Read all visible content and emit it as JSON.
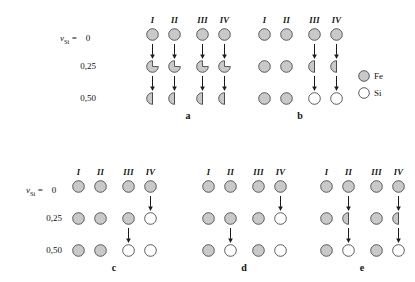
{
  "figure": {
    "decimal_separator": ",",
    "colors": {
      "fe_fill": "#c9c9c9",
      "si_fill": "#ffffff",
      "outline": "#4a4a4a",
      "arrow": "#1a1a1a",
      "background": "#ffffff",
      "text": "#111111"
    },
    "axis_label": {
      "symbol": "ν",
      "subscript": "Si",
      "equals": "="
    },
    "row_labels": [
      "0",
      "0,25",
      "0,50"
    ],
    "column_headers": [
      "I",
      "II",
      "III",
      "IV"
    ],
    "legend": {
      "items": [
        {
          "label": "Fe",
          "kind": "full-gray"
        },
        {
          "label": "Si",
          "kind": "full-white"
        }
      ]
    },
    "panels": [
      {
        "id": "a",
        "label": "a",
        "columns": [
          "I",
          "II",
          "III",
          "IV"
        ],
        "rows": [
          {
            "value": "0",
            "atoms": [
              "full-gray",
              "full-gray",
              "full-gray",
              "full-gray"
            ]
          },
          {
            "value": "0,25",
            "atoms": [
              "pac-gray",
              "pac-gray",
              "pac-gray",
              "pac-gray"
            ]
          },
          {
            "value": "0,50",
            "atoms": [
              "half-gray",
              "half-gray",
              "half-gray",
              "half-gray"
            ]
          }
        ],
        "arrows": [
          {
            "from_row": 0,
            "to_row": 1,
            "column": 0
          },
          {
            "from_row": 0,
            "to_row": 1,
            "column": 1
          },
          {
            "from_row": 0,
            "to_row": 1,
            "column": 2
          },
          {
            "from_row": 0,
            "to_row": 1,
            "column": 3
          },
          {
            "from_row": 1,
            "to_row": 2,
            "column": 0
          },
          {
            "from_row": 1,
            "to_row": 2,
            "column": 1
          },
          {
            "from_row": 1,
            "to_row": 2,
            "column": 2
          },
          {
            "from_row": 1,
            "to_row": 2,
            "column": 3
          }
        ]
      },
      {
        "id": "b",
        "label": "b",
        "columns": [
          "I",
          "II",
          "III",
          "IV"
        ],
        "rows": [
          {
            "value": "0",
            "atoms": [
              "full-gray",
              "full-gray",
              "full-gray",
              "full-gray"
            ]
          },
          {
            "value": "0,25",
            "atoms": [
              "full-gray",
              "full-gray",
              "half-gray",
              "half-gray"
            ]
          },
          {
            "value": "0,50",
            "atoms": [
              "full-gray",
              "full-gray",
              "full-white",
              "full-white"
            ]
          }
        ],
        "arrows": [
          {
            "from_row": 0,
            "to_row": 1,
            "column": 2
          },
          {
            "from_row": 0,
            "to_row": 1,
            "column": 3
          },
          {
            "from_row": 1,
            "to_row": 2,
            "column": 2
          },
          {
            "from_row": 1,
            "to_row": 2,
            "column": 3
          }
        ]
      },
      {
        "id": "c",
        "label": "c",
        "columns": [
          "I",
          "II",
          "III",
          "IV"
        ],
        "rows": [
          {
            "value": "0",
            "atoms": [
              "full-gray",
              "full-gray",
              "full-gray",
              "full-gray"
            ]
          },
          {
            "value": "0,25",
            "atoms": [
              "full-gray",
              "full-gray",
              "full-gray",
              "full-white"
            ]
          },
          {
            "value": "0,50",
            "atoms": [
              "full-gray",
              "full-gray",
              "full-white",
              "full-white"
            ]
          }
        ],
        "arrows": [
          {
            "from_row": 0,
            "to_row": 1,
            "column": 3
          },
          {
            "from_row": 1,
            "to_row": 2,
            "column": 2
          }
        ]
      },
      {
        "id": "d",
        "label": "d",
        "columns": [
          "I",
          "II",
          "III",
          "IV"
        ],
        "rows": [
          {
            "value": "0",
            "atoms": [
              "full-gray",
              "full-gray",
              "full-gray",
              "full-gray"
            ]
          },
          {
            "value": "0,25",
            "atoms": [
              "full-gray",
              "full-gray",
              "full-gray",
              "full-white"
            ]
          },
          {
            "value": "0,50",
            "atoms": [
              "full-gray",
              "full-white",
              "full-gray",
              "full-white"
            ]
          }
        ],
        "arrows": [
          {
            "from_row": 0,
            "to_row": 1,
            "column": 3
          },
          {
            "from_row": 1,
            "to_row": 2,
            "column": 1
          }
        ]
      },
      {
        "id": "e",
        "label": "e",
        "columns": [
          "I",
          "II",
          "III",
          "IV"
        ],
        "rows": [
          {
            "value": "0",
            "atoms": [
              "full-gray",
              "full-gray",
              "full-gray",
              "full-gray"
            ]
          },
          {
            "value": "0,25",
            "atoms": [
              "full-gray",
              "half-gray",
              "full-gray",
              "half-gray"
            ]
          },
          {
            "value": "0,50",
            "atoms": [
              "full-gray",
              "full-white",
              "full-gray",
              "full-white"
            ]
          }
        ],
        "arrows": [
          {
            "from_row": 0,
            "to_row": 1,
            "column": 1
          },
          {
            "from_row": 0,
            "to_row": 1,
            "column": 3
          },
          {
            "from_row": 1,
            "to_row": 2,
            "column": 1
          },
          {
            "from_row": 1,
            "to_row": 2,
            "column": 3
          }
        ]
      }
    ]
  }
}
